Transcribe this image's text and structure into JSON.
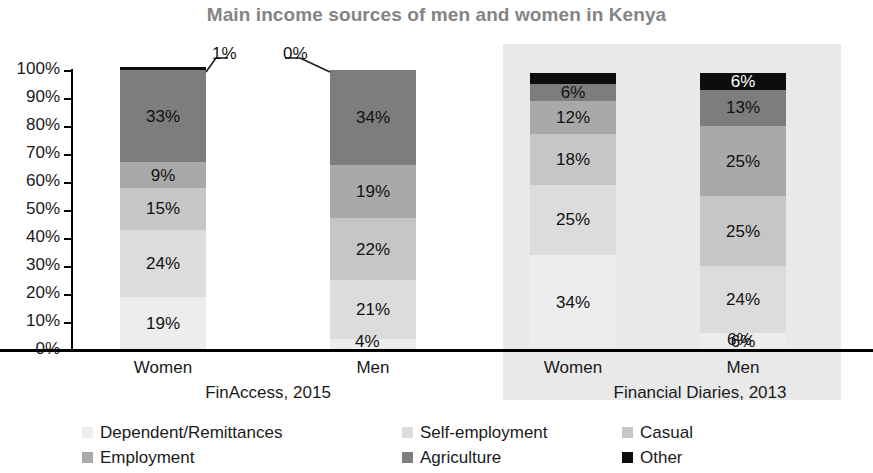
{
  "chart_data": {
    "type": "bar",
    "subtype": "stacked-100-percent",
    "title": "Main income sources of men and women in Kenya",
    "xlabel": "",
    "ylabel": "",
    "ylim": [
      0,
      100
    ],
    "ytick_labels": [
      "100%",
      "90%",
      "80%",
      "70%",
      "60%",
      "50%",
      "40%",
      "30%",
      "20%",
      "10%",
      "0%"
    ],
    "ytick_values": [
      100,
      90,
      80,
      70,
      60,
      50,
      40,
      30,
      20,
      10,
      0
    ],
    "grid": false,
    "legend_position": "bottom",
    "categories": [
      "Women",
      "Men",
      "Women",
      "Men"
    ],
    "groups": [
      {
        "label": "FinAccess, 2015",
        "categories": [
          "Women",
          "Men"
        ],
        "shaded": false
      },
      {
        "label": "Financial Diaries, 2013",
        "categories": [
          "Women",
          "Men"
        ],
        "shaded": true
      }
    ],
    "series": [
      {
        "name": "Dependent/Remittances",
        "color": "#ededed",
        "values": [
          19,
          4,
          34,
          6
        ]
      },
      {
        "name": "Self-employment",
        "color": "#dcdcdc",
        "values": [
          24,
          21,
          25,
          24
        ]
      },
      {
        "name": "Casual",
        "color": "#c6c6c6",
        "values": [
          15,
          22,
          18,
          25
        ]
      },
      {
        "name": "Employment",
        "color": "#a9a9a9",
        "values": [
          9,
          19,
          12,
          25
        ]
      },
      {
        "name": "Agriculture",
        "color": "#7d7d7d",
        "values": [
          33,
          34,
          6,
          13
        ]
      },
      {
        "name": "Other",
        "color": "#0d0d0d",
        "values": [
          1,
          0,
          4,
          6
        ]
      }
    ],
    "data_labels": [
      [
        "19%",
        "24%",
        "15%",
        "9%",
        "33%",
        "1%"
      ],
      [
        "4%",
        "21%",
        "22%",
        "19%",
        "34%",
        "0%"
      ],
      [
        "34%",
        "25%",
        "18%",
        "12%",
        "6%",
        "4%"
      ],
      [
        "6%",
        "24%",
        "25%",
        "25%",
        "13%",
        "6%"
      ]
    ],
    "callouts": [
      {
        "label": "1%",
        "bar": 0,
        "series": "Other"
      },
      {
        "label": "0%",
        "bar": 1,
        "series": "Other"
      }
    ],
    "title_color": "#848484",
    "panel_shade_color": "#e9e9e9"
  }
}
